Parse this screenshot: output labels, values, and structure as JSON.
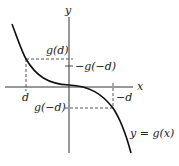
{
  "diagram": {
    "axes": {
      "x_label": "x",
      "y_label": "y"
    },
    "curve_label": "y = g(x)",
    "x_ticks": [
      {
        "label": "d"
      },
      {
        "label": "−d"
      }
    ],
    "y_ticks": [
      {
        "label": "g(d)"
      },
      {
        "label": "−g(−d)"
      },
      {
        "label": "g(−d)"
      }
    ],
    "colors": {
      "curve": "#111111",
      "axis": "#333333",
      "dashed": "#444444"
    }
  }
}
